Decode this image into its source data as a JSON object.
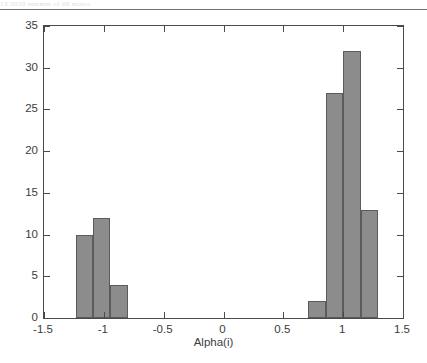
{
  "page": {
    "top_artifact_text": "13 2020 mmmm of 08 minor",
    "background": "#ffffff"
  },
  "chart_data": {
    "type": "bar",
    "subtype": "histogram",
    "title": "",
    "xlabel": "Alpha(i)",
    "ylabel": "",
    "xlim": [
      -1.5,
      1.5
    ],
    "ylim": [
      0,
      35
    ],
    "xticks": [
      -1.5,
      -1,
      -0.5,
      0,
      0.5,
      1,
      1.5
    ],
    "xticklabels": [
      "-1.5",
      "-1",
      "-0.5",
      "0",
      "0.5",
      "1",
      "1.5"
    ],
    "yticks": [
      0,
      5,
      10,
      15,
      20,
      25,
      30,
      35
    ],
    "yticklabels": [
      "0",
      "5",
      "10",
      "15",
      "20",
      "25",
      "30",
      "35"
    ],
    "grid": false,
    "legend": null,
    "bar_color": "#8c8c8c",
    "bar_edge_color": "#5b5b5b",
    "axis_color": "#4a4a4a",
    "bin_width": 0.145,
    "bars": [
      {
        "left": -1.235,
        "right": -1.09,
        "center": -1.163,
        "value": 10
      },
      {
        "left": -1.09,
        "right": -0.945,
        "center": -1.018,
        "value": 12
      },
      {
        "left": -0.945,
        "right": -0.8,
        "center": -0.873,
        "value": 4
      },
      {
        "left": 0.71,
        "right": 0.855,
        "center": 0.783,
        "value": 2
      },
      {
        "left": 0.855,
        "right": 1.0,
        "center": 0.928,
        "value": 27
      },
      {
        "left": 1.0,
        "right": 1.145,
        "center": 1.073,
        "value": 32
      },
      {
        "left": 1.145,
        "right": 1.29,
        "center": 1.218,
        "value": 13
      }
    ],
    "categories": [
      "-1.16",
      "-1.02",
      "-0.87",
      "0.78",
      "0.93",
      "1.07",
      "1.22"
    ],
    "values": [
      10,
      12,
      4,
      2,
      27,
      32,
      13
    ]
  }
}
